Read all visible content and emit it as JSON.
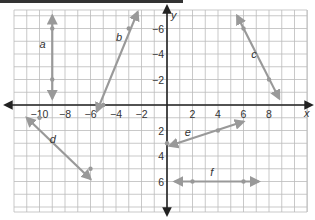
{
  "chart_data": {
    "type": "line",
    "title": "",
    "xlabel": "x",
    "ylabel": "y",
    "xlim": [
      -12,
      11
    ],
    "ylim": [
      -8,
      7
    ],
    "grid": true,
    "x_ticks": [
      -10,
      -8,
      -6,
      -4,
      -2,
      2,
      4,
      6,
      8
    ],
    "y_ticks": [
      -6,
      -4,
      -2,
      2,
      4,
      6
    ],
    "series": [
      {
        "name": "a",
        "points": [
          [
            -9,
            6
          ],
          [
            -9,
            2
          ]
        ],
        "endpoints": [
          [
            -9,
            7
          ],
          [
            -9,
            0.5
          ]
        ],
        "label_pos": [
          -10,
          4.5
        ]
      },
      {
        "name": "b",
        "points": [
          [
            -3,
            6
          ],
          [
            -5,
            0
          ]
        ],
        "endpoints": [
          [
            -2.3,
            7.3
          ],
          [
            -5.5,
            -0.5
          ]
        ],
        "label_pos": [
          -4,
          5
        ]
      },
      {
        "name": "c",
        "points": [
          [
            6,
            6
          ],
          [
            8,
            2
          ]
        ],
        "endpoints": [
          [
            5.5,
            7
          ],
          [
            8.8,
            0.5
          ]
        ],
        "label_pos": [
          6.6,
          3.7
        ]
      },
      {
        "name": "d",
        "points": [
          [
            -10,
            -1
          ],
          [
            -6,
            -5
          ]
        ],
        "endpoints": [
          [
            -11,
            -1
          ],
          [
            -6,
            -5.8
          ]
        ],
        "label_pos": [
          -9.2,
          -3
        ]
      },
      {
        "name": "e",
        "points": [
          [
            0,
            -3
          ],
          [
            4,
            -2
          ]
        ],
        "endpoints": [
          [
            0.2,
            -3.2
          ],
          [
            6,
            -1.3
          ]
        ],
        "label_pos": [
          1.4,
          -2.4
        ]
      },
      {
        "name": "f",
        "points": [
          [
            2,
            -6
          ],
          [
            6,
            -6
          ]
        ],
        "endpoints": [
          [
            0.6,
            -6
          ],
          [
            7.2,
            -6
          ]
        ],
        "label_pos": [
          3.4,
          -5.6
        ]
      }
    ]
  },
  "axes": {
    "x_label": "x",
    "y_label": "y"
  },
  "ticks": {
    "x": [
      "−10",
      "−8",
      "−6",
      "−4",
      "−2",
      "2",
      "4",
      "6",
      "8"
    ],
    "y": [
      "6",
      "4",
      "2",
      "−2",
      "−4",
      "−6"
    ]
  },
  "labels": {
    "a": "a",
    "b": "b",
    "c": "c",
    "d": "d",
    "e": "e",
    "f": "f"
  },
  "colors": {
    "axis": "#222222",
    "grid": "#bbbbbb",
    "line": "#999999"
  }
}
